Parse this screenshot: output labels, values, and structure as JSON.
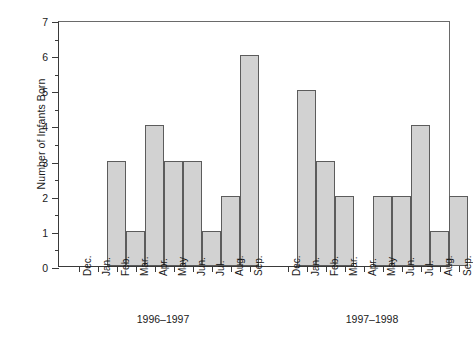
{
  "chart_data": {
    "type": "bar",
    "title": "",
    "xlabel": "",
    "ylabel": "Number of Infants Born",
    "ylim": [
      0,
      7
    ],
    "y_ticks": [
      0,
      1,
      2,
      3,
      4,
      5,
      6,
      7
    ],
    "y_minor_ticks": [
      0.5,
      1.5,
      2.5,
      3.5,
      4.5,
      5.5,
      6.5
    ],
    "grid": false,
    "legend": "none",
    "categories": [
      "Dec.",
      "Jan.",
      "Feb.",
      "Mar.",
      "Apr.",
      "May",
      "Jun.",
      "Jul.",
      "Aug.",
      "Sep.",
      "Dec.",
      "Jan.",
      "Feb.",
      "Mar.",
      "Apr.",
      "May",
      "Jun.",
      "Jul.",
      "Aug.",
      "Sep."
    ],
    "values": [
      0,
      0,
      3,
      1,
      4,
      3,
      3,
      1,
      2,
      6,
      0,
      5,
      3,
      2,
      0,
      2,
      2,
      4,
      1,
      2
    ],
    "groups": [
      {
        "label": "1996–1997",
        "categories": [
          "Dec.",
          "Jan.",
          "Feb.",
          "Mar.",
          "Apr.",
          "May",
          "Jun.",
          "Jul.",
          "Aug.",
          "Sep."
        ],
        "values": [
          0,
          0,
          3,
          1,
          4,
          3,
          3,
          1,
          2,
          6
        ]
      },
      {
        "label": "1997–1998",
        "categories": [
          "Dec.",
          "Jan.",
          "Feb.",
          "Mar.",
          "Apr.",
          "May",
          "Jun.",
          "Jul.",
          "Aug.",
          "Sep."
        ],
        "values": [
          0,
          5,
          3,
          2,
          0,
          2,
          2,
          4,
          1,
          2
        ]
      }
    ],
    "colors": {
      "bar_fill": "#d2d2d2",
      "bar_stroke": "#5c5c5c",
      "axis": "#3a3a3a",
      "text": "#1a1a1a",
      "background": "#ffffff"
    }
  }
}
